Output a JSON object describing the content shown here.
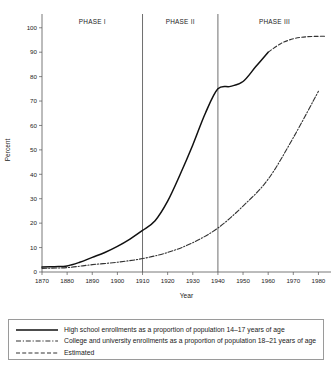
{
  "chart_data": {
    "type": "line",
    "title": "",
    "xlabel": "Year",
    "ylabel": "Percent",
    "xlim": [
      1870,
      1985
    ],
    "ylim": [
      0,
      104
    ],
    "grid": false,
    "legend_position": "below-plot",
    "xticks": [
      1870,
      1880,
      1890,
      1900,
      1910,
      1920,
      1930,
      1940,
      1950,
      1960,
      1970,
      1980
    ],
    "yticks": [
      0,
      10,
      20,
      30,
      40,
      50,
      60,
      70,
      80,
      90,
      100
    ],
    "annotations": [
      {
        "label": "PHASE I",
        "span": [
          1870,
          1910
        ]
      },
      {
        "label": "PHASE II",
        "span": [
          1910,
          1940
        ]
      },
      {
        "label": "PHASE III",
        "span": [
          1940,
          1985
        ]
      }
    ],
    "dividers": [
      1910,
      1940
    ],
    "series": [
      {
        "name": "High school enrollments as a proportion of population 14–17 years of age",
        "style": "solid",
        "x": [
          1870,
          1875,
          1880,
          1885,
          1890,
          1895,
          1900,
          1905,
          1910,
          1915,
          1920,
          1925,
          1930,
          1935,
          1940,
          1945,
          1950,
          1955,
          1960
        ],
        "values": [
          2,
          2.2,
          2.5,
          4,
          6,
          8,
          10.5,
          13.5,
          17,
          21,
          29,
          40,
          52,
          65,
          75,
          76,
          78,
          84,
          90
        ]
      },
      {
        "name": "Estimated",
        "style": "dashed",
        "x": [
          1960,
          1965,
          1970,
          1975,
          1980,
          1983
        ],
        "values": [
          90,
          93.5,
          95.5,
          96.3,
          96.5,
          96.5
        ]
      },
      {
        "name": "College and university enrollments as a proportion of population 18–21 years of age",
        "style": "dash-dot",
        "x": [
          1870,
          1880,
          1890,
          1900,
          1910,
          1920,
          1930,
          1940,
          1950,
          1960,
          1970,
          1980
        ],
        "values": [
          1.5,
          1.8,
          3,
          4,
          5.5,
          8,
          12,
          18,
          27,
          38,
          55,
          74
        ]
      }
    ]
  },
  "legend": {
    "items": [
      {
        "swatch": "solid-line-swatch",
        "label": "High school enrollments as a proportion of population 14–17 years of age"
      },
      {
        "swatch": "dash-dot-line-swatch",
        "label": "College and university enrollments as a proportion of population 18–21 years of age"
      },
      {
        "swatch": "dashed-line-swatch",
        "label": "Estimated"
      }
    ]
  }
}
